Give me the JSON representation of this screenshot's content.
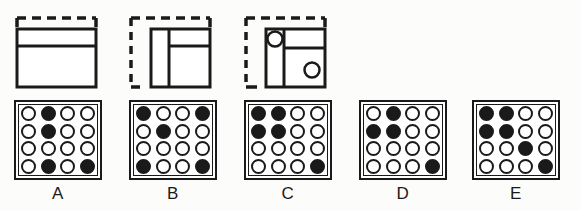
{
  "figure": {
    "colors": {
      "ink": "#1a1a1a",
      "paper": "#ffffff",
      "background": "#fcfcfb"
    }
  },
  "fold_sequence": {
    "label": "fold-sequence",
    "steps": [
      {
        "name": "step-1",
        "description": "Square sheet shown with a dashed outline along the top edge and a solid rectangle divided by one horizontal line near the top.",
        "dashed_edges": [
          "top"
        ],
        "solid_lines": [
          "horizontal"
        ],
        "circles": 0
      },
      {
        "name": "step-2",
        "description": "Dashed outline along the top and left edges; solid square divided by a vertical line on the left and a horizontal line in the right portion.",
        "dashed_edges": [
          "top",
          "left"
        ],
        "solid_lines": [
          "vertical",
          "horizontal"
        ],
        "circles": 0
      },
      {
        "name": "step-3",
        "description": "Dashed outline along top, left and bottom edges; solid square with a vertical divider, a horizontal divider on the right, one punched circle at upper-left and one at lower-right.",
        "dashed_edges": [
          "top",
          "left",
          "bottom"
        ],
        "solid_lines": [
          "vertical",
          "horizontal"
        ],
        "circles": 2
      }
    ]
  },
  "answer_options": {
    "label": "answer-options",
    "grid_size": {
      "rows": 4,
      "cols": 4
    },
    "legend": {
      "filled": "punched hole",
      "empty": "unpunched"
    },
    "options": [
      {
        "label": "A",
        "name": "option-a",
        "cells": [
          [
            0,
            1,
            0,
            0
          ],
          [
            0,
            1,
            0,
            0
          ],
          [
            0,
            0,
            0,
            0
          ],
          [
            0,
            1,
            0,
            1
          ]
        ]
      },
      {
        "label": "B",
        "name": "option-b",
        "cells": [
          [
            1,
            0,
            0,
            1
          ],
          [
            0,
            1,
            0,
            0
          ],
          [
            0,
            0,
            0,
            0
          ],
          [
            1,
            0,
            0,
            1
          ]
        ]
      },
      {
        "label": "C",
        "name": "option-c",
        "cells": [
          [
            1,
            1,
            0,
            0
          ],
          [
            1,
            1,
            0,
            0
          ],
          [
            0,
            0,
            0,
            0
          ],
          [
            0,
            0,
            0,
            1
          ]
        ]
      },
      {
        "label": "D",
        "name": "option-d",
        "cells": [
          [
            0,
            1,
            0,
            0
          ],
          [
            1,
            1,
            0,
            0
          ],
          [
            0,
            0,
            0,
            0
          ],
          [
            0,
            0,
            0,
            1
          ]
        ]
      },
      {
        "label": "E",
        "name": "option-e",
        "cells": [
          [
            1,
            1,
            0,
            0
          ],
          [
            1,
            1,
            0,
            0
          ],
          [
            0,
            0,
            1,
            0
          ],
          [
            0,
            0,
            0,
            1
          ]
        ]
      }
    ]
  }
}
